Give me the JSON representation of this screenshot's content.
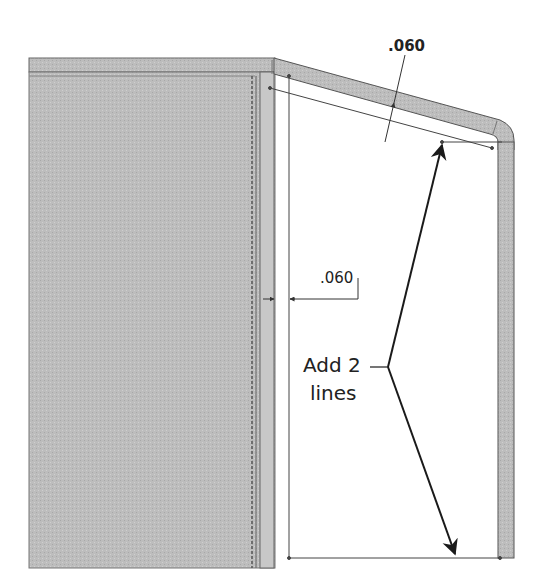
{
  "drawing": {
    "dimension_top": ".060",
    "dimension_side": ".060",
    "callout_line1": "Add 2",
    "callout_line2": "lines",
    "colors": {
      "panel_fill": "#b9b9b9",
      "flange_fill": "#c6c6c6",
      "outline": "#555555",
      "arrow": "#1a1a1a",
      "sketch_line": "#444444"
    }
  }
}
